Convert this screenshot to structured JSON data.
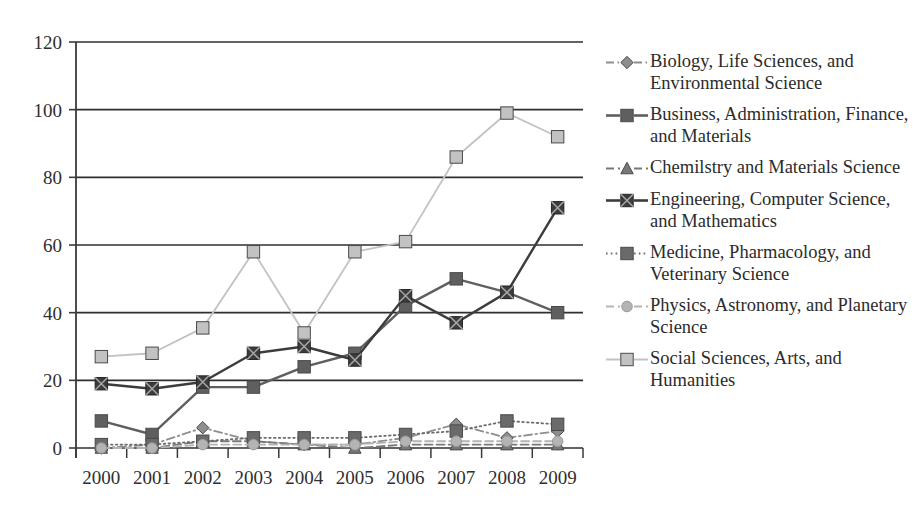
{
  "chart_data": {
    "type": "line",
    "title": "",
    "xlabel": "",
    "ylabel": "",
    "categories": [
      "2000",
      "2001",
      "2002",
      "2003",
      "2004",
      "2005",
      "2006",
      "2007",
      "2008",
      "2009"
    ],
    "ylim": [
      0,
      120
    ],
    "ytick_values": [
      0,
      20,
      40,
      60,
      80,
      100,
      120
    ],
    "ytick_labels": [
      "0",
      "20",
      "40",
      "60",
      "80",
      "100",
      "120"
    ],
    "grid": "horizontal",
    "legend_position": "right",
    "series": [
      {
        "name": "Biology, Life Sciences, and Environmental Science",
        "marker": "diamond",
        "line_style": "dash-dot",
        "color": "#8e8e8e",
        "values": [
          0,
          1,
          6,
          2,
          1,
          1,
          3,
          7,
          3,
          5
        ]
      },
      {
        "name": "Business, Administration, Finance, and Materials",
        "marker": "square",
        "line_style": "solid",
        "color": "#5f5f5f",
        "values": [
          8,
          4,
          18,
          18,
          24,
          28,
          42,
          50,
          46,
          40
        ]
      },
      {
        "name": "Chemilstry and Materials Science",
        "marker": "triangle",
        "line_style": "dashed",
        "color": "#787878",
        "values": [
          0,
          0,
          2,
          2,
          1,
          0,
          1,
          1,
          1,
          1
        ]
      },
      {
        "name": "Engineering, Computer Science, and Mathematics",
        "marker": "x-square",
        "line_style": "solid",
        "color": "#3c3c3c",
        "values": [
          19,
          17.5,
          19.5,
          28,
          30,
          26,
          45,
          37,
          46,
          71
        ]
      },
      {
        "name": "Medicine, Pharmacology, and Veterinary Science",
        "marker": "square",
        "line_style": "dotted",
        "color": "#6a6a6a",
        "values": [
          1,
          1,
          2,
          3,
          3,
          3,
          4,
          5,
          8,
          7
        ]
      },
      {
        "name": "Physics, Astronomy, and Planetary Science",
        "marker": "circle",
        "line_style": "dashed",
        "color": "#b4b4b4",
        "values": [
          0,
          0,
          1,
          1,
          1,
          1,
          2,
          2,
          2,
          2
        ]
      },
      {
        "name": "Social Sciences, Arts, and Humanities",
        "marker": "square",
        "line_style": "solid",
        "color": "#c2c2c2",
        "values": [
          27,
          28,
          35.5,
          58,
          34,
          58,
          61,
          86,
          99,
          92
        ]
      }
    ]
  },
  "legend": {
    "items": [
      {
        "label": "Biology, Life Sciences, and Environmental Science"
      },
      {
        "label": "Business, Administration, Finance, and Materials"
      },
      {
        "label": "Chemilstry and Materials Science"
      },
      {
        "label": "Engineering, Computer Science, and Mathematics"
      },
      {
        "label": "Medicine, Pharmacology, and Veterinary Science"
      },
      {
        "label": "Physics, Astronomy, and Planetary Science"
      },
      {
        "label": "Social Sciences, Arts, and Humanities"
      }
    ]
  },
  "axes": {
    "y_labels": [
      "120",
      "100",
      "80",
      "60",
      "40",
      "20",
      "0"
    ],
    "x_labels": [
      "2000",
      "2001",
      "2002",
      "2003",
      "2004",
      "2005",
      "2006",
      "2007",
      "2008",
      "2009"
    ]
  },
  "colors": {
    "axis": "#3a3a3a",
    "gridline": "#2f2f2f",
    "background": "#ffffff"
  }
}
